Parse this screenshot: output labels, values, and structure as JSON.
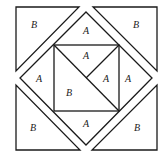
{
  "diagram": {
    "pieces": {
      "corner_top_left": "B",
      "corner_top_right": "B",
      "corner_bottom_left": "B",
      "corner_bottom_right": "B",
      "diamond_top": "A",
      "diamond_left": "A",
      "diamond_right": "A",
      "diamond_bottom": "A",
      "inner_top": "A",
      "inner_right": "A",
      "inner_lower_left": "B"
    },
    "colors": {
      "stroke": "#1a1a1a",
      "fill": "#ffffff",
      "label": "#222222"
    }
  }
}
